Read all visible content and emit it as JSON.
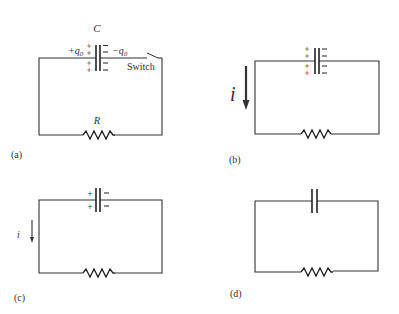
{
  "figure": {
    "panels": [
      {
        "id": "a",
        "label": "(a)",
        "capacitor_label": "C",
        "plus_charge_label": "+q",
        "plus_charge_sub": "0",
        "minus_charge_label": "−q",
        "minus_charge_sub": "0",
        "switch_label": "Switch",
        "resistor_label": "R",
        "plus_signs": [
          "+",
          "+",
          "+",
          "+"
        ],
        "minus_signs": [
          "−",
          "−",
          "−",
          "−"
        ],
        "switch_state": "open"
      },
      {
        "id": "b",
        "label": "(b)",
        "current_label": "i",
        "plus_signs": [
          "+",
          "+",
          "+",
          "+"
        ],
        "minus_signs": [
          "−",
          "−",
          "−",
          "−"
        ],
        "arrow": "large"
      },
      {
        "id": "c",
        "label": "(c)",
        "current_label": "i",
        "plus_signs": [
          "+",
          "+"
        ],
        "minus_signs": [
          "−",
          "−"
        ],
        "arrow": "small"
      },
      {
        "id": "d",
        "label": "(d)",
        "plus_signs": [],
        "minus_signs": []
      }
    ],
    "colors": {
      "line": "#333333",
      "background": "#ffffff"
    }
  }
}
